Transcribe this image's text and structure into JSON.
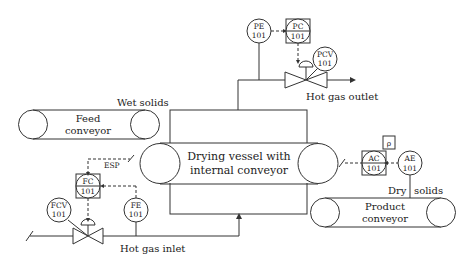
{
  "diagram": {
    "type": "P&ID - drying process control",
    "equipment": {
      "feed_conveyor": {
        "line1": "Feed",
        "line2": "conveyor"
      },
      "drying_vessel": {
        "line1": "Drying vessel with",
        "line2": "internal conveyor"
      },
      "product_conveyor": {
        "line1": "Product",
        "line2": "conveyor"
      }
    },
    "streams": {
      "wet_solids": "Wet solids",
      "hot_gas_outlet": "Hot gas outlet",
      "hot_gas_inlet": "Hot gas inlet",
      "dry": "Dry",
      "solids": "solids"
    },
    "instruments": {
      "pe": {
        "tag": "PE",
        "num": "101"
      },
      "pc": {
        "tag": "PC",
        "num": "101"
      },
      "pcv": {
        "tag": "PCV",
        "num": "101"
      },
      "fc": {
        "tag": "FC",
        "num": "101"
      },
      "fe": {
        "tag": "FE",
        "num": "101"
      },
      "fcv": {
        "tag": "FCV",
        "num": "101"
      },
      "ac": {
        "tag": "AC",
        "num": "101"
      },
      "ae": {
        "tag": "AE",
        "num": "101"
      }
    },
    "signals": {
      "esp": "ESP",
      "rho": "ρ"
    },
    "colors": {
      "line": "#333333",
      "background": "#ffffff"
    }
  }
}
